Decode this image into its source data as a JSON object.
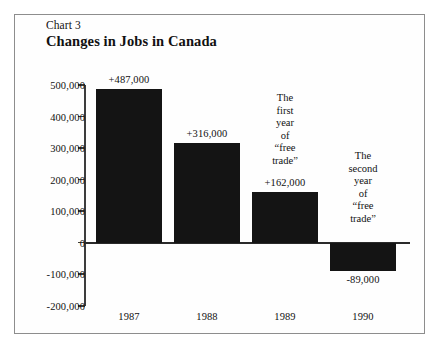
{
  "frame": {
    "border_color": "#8d8d8d"
  },
  "header": {
    "chart_number": "Chart 3",
    "title": "Changes in Jobs in Canada"
  },
  "chart_data": {
    "type": "bar",
    "title": "Changes in Jobs in Canada",
    "subtitle": "Chart 3",
    "xlabel": "",
    "ylabel": "",
    "categories": [
      "1987",
      "1988",
      "1989",
      "1990"
    ],
    "values": [
      487000,
      316000,
      162000,
      -89000
    ],
    "value_labels": [
      "+487,000",
      "+316,000",
      "+162,000",
      "-89,000"
    ],
    "ylim": [
      -200000,
      500000
    ],
    "ytick_values": [
      500000,
      400000,
      300000,
      200000,
      100000,
      0,
      -100000,
      -200000
    ],
    "ytick_labels": [
      "500,000",
      "400,000",
      "300,000",
      "200,000",
      "100,000",
      "0",
      "-100,000",
      "-200,000"
    ],
    "grid": false,
    "legend": "none",
    "bar_color": "#141414",
    "annotations": [
      {
        "attached_to": "1989",
        "lines": [
          "The",
          "first",
          "year",
          "of",
          "“free",
          "trade”"
        ]
      },
      {
        "attached_to": "1990",
        "lines": [
          "The",
          "second",
          "year",
          "of",
          "“free",
          "trade”"
        ]
      }
    ]
  }
}
